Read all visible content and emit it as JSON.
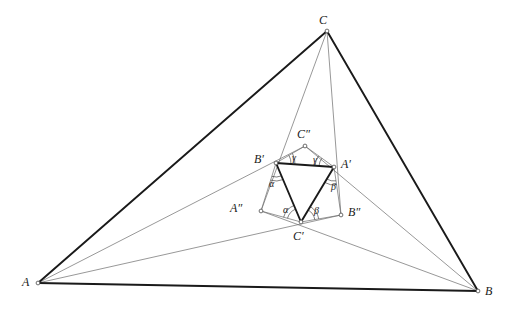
{
  "figure": {
    "kind": "geometry-diagram",
    "width": 507,
    "height": 316,
    "background": "#ffffff",
    "stroke_thick": "#1a1a1a",
    "stroke_thin": "#6b6b6b",
    "stroke_medium": "#2a2a2a",
    "point_fill": "#ffffff",
    "point_stroke": "#4a4a4a"
  },
  "points": {
    "A": {
      "label": "A",
      "x": 38,
      "y": 283
    },
    "B": {
      "label": "B",
      "x": 478,
      "y": 291
    },
    "C": {
      "label": "C",
      "x": 327,
      "y": 31
    },
    "Ap": {
      "label": "A′",
      "x": 334,
      "y": 167
    },
    "Bp": {
      "label": "B′",
      "x": 276,
      "y": 163
    },
    "Cp": {
      "label": "C′",
      "x": 301,
      "y": 222
    },
    "App": {
      "label": "A″",
      "x": 261,
      "y": 211
    },
    "Bpp": {
      "label": "B″",
      "x": 341,
      "y": 215
    },
    "Cpp": {
      "label": "C″",
      "x": 305,
      "y": 146
    }
  },
  "vertex_labels": [
    {
      "name": "label-A",
      "text": "A",
      "x": 22,
      "y": 276
    },
    {
      "name": "label-B",
      "text": "B",
      "x": 485,
      "y": 285
    },
    {
      "name": "label-C",
      "text": "C",
      "x": 319,
      "y": 14
    },
    {
      "name": "label-A1",
      "text": "A′",
      "x": 341,
      "y": 158
    },
    {
      "name": "label-B1",
      "text": "B′",
      "x": 254,
      "y": 153
    },
    {
      "name": "label-C1",
      "text": "C′",
      "x": 293,
      "y": 230
    },
    {
      "name": "label-A2",
      "text": "A″",
      "x": 230,
      "y": 202
    },
    {
      "name": "label-B2",
      "text": "B″",
      "x": 348,
      "y": 206
    },
    {
      "name": "label-C2",
      "text": "C″",
      "x": 297,
      "y": 128
    }
  ],
  "angle_labels": [
    {
      "name": "angle-alpha-at-B1",
      "text": "α",
      "x": 269,
      "y": 179
    },
    {
      "name": "angle-alpha-at-C1",
      "text": "α",
      "x": 283,
      "y": 205
    },
    {
      "name": "angle-beta-at-A1",
      "text": "β",
      "x": 331,
      "y": 182
    },
    {
      "name": "angle-beta-at-C1",
      "text": "β",
      "x": 314,
      "y": 206
    },
    {
      "name": "angle-gamma-left",
      "text": "γ",
      "x": 292,
      "y": 153
    },
    {
      "name": "angle-gamma-right",
      "text": "γ",
      "x": 313,
      "y": 155
    }
  ],
  "outer_triangle": {
    "name": "triangle-ABC",
    "edges": [
      {
        "name": "edge-AC",
        "from": "A",
        "to": "C"
      },
      {
        "name": "edge-CB",
        "from": "C",
        "to": "B"
      },
      {
        "name": "edge-AB",
        "from": "A",
        "to": "B"
      }
    ]
  },
  "inner_triangle": {
    "name": "triangle-A1B1C1",
    "edges": [
      {
        "name": "edge-B1A1",
        "from": "Bp",
        "to": "Ap"
      },
      {
        "name": "edge-A1C1",
        "from": "Ap",
        "to": "Cp"
      },
      {
        "name": "edge-C1B1",
        "from": "Cp",
        "to": "Bp"
      }
    ]
  },
  "hexagon": {
    "name": "hexagon-B1C2A1B2C1A2",
    "edges": [
      {
        "name": "edge-B1C2",
        "from": "Bp",
        "to": "Cpp"
      },
      {
        "name": "edge-C2A1",
        "from": "Cpp",
        "to": "Ap"
      },
      {
        "name": "edge-A1B2",
        "from": "Ap",
        "to": "Bpp"
      },
      {
        "name": "edge-B2C1",
        "from": "Bpp",
        "to": "Cp"
      },
      {
        "name": "edge-C1A2",
        "from": "Cp",
        "to": "App"
      },
      {
        "name": "edge-A2B1",
        "from": "App",
        "to": "Bp"
      }
    ]
  },
  "cevians": [
    {
      "name": "cevian-A-to-B1",
      "from": "A",
      "to": "Bp",
      "extend_to": "Cpp"
    },
    {
      "name": "cevian-A-to-C1",
      "from": "A",
      "to": "Cp",
      "extend_to": "Bpp"
    },
    {
      "name": "cevian-B-to-A1",
      "from": "B",
      "to": "Ap",
      "extend_to": "Cpp"
    },
    {
      "name": "cevian-B-to-C1",
      "from": "B",
      "to": "Cp",
      "extend_to": "App"
    },
    {
      "name": "cevian-C-to-B1",
      "from": "C",
      "to": "Bp",
      "extend_to": "App"
    },
    {
      "name": "cevian-C-to-A1",
      "from": "C",
      "to": "Ap",
      "extend_to": "Bpp"
    }
  ]
}
